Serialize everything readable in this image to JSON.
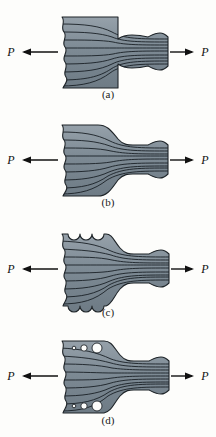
{
  "figure": {
    "background_color": "#fdfdfb",
    "body_fill_color": "#7d8a94",
    "body_fill_light": "#97a2ab",
    "body_fill_dark": "#6b7882",
    "outline_color": "#1e2428",
    "flow_line_color": "#1a2026",
    "hole_fill_color": "#fdfdfb",
    "arrow_color": "#111111",
    "label_color": "#1a1a1a"
  },
  "panels": [
    {
      "id": "a",
      "caption": "(a)",
      "description": "abrupt square shoulder step",
      "left_load_label": "P",
      "right_load_label": "P",
      "left_arrow_direction": "left",
      "right_arrow_direction": "right",
      "flow_line_count": 9,
      "notch_count": 0,
      "hole_count": 0
    },
    {
      "id": "b",
      "caption": "(b)",
      "description": "gradual filleted taper transition",
      "left_load_label": "P",
      "right_load_label": "P",
      "left_arrow_direction": "left",
      "right_arrow_direction": "right",
      "flow_line_count": 9,
      "notch_count": 0,
      "hole_count": 0
    },
    {
      "id": "c",
      "caption": "(c)",
      "description": "taper with semicircular edge notches top and bottom",
      "left_load_label": "P",
      "right_load_label": "P",
      "left_arrow_direction": "left",
      "right_arrow_direction": "right",
      "flow_line_count": 9,
      "notch_count": 6,
      "hole_count": 0
    },
    {
      "id": "d",
      "caption": "(d)",
      "description": "taper with three graduated circular holes top and bottom",
      "left_load_label": "P",
      "right_load_label": "P",
      "left_arrow_direction": "left",
      "right_arrow_direction": "right",
      "flow_line_count": 9,
      "notch_count": 0,
      "hole_count": 6
    }
  ]
}
